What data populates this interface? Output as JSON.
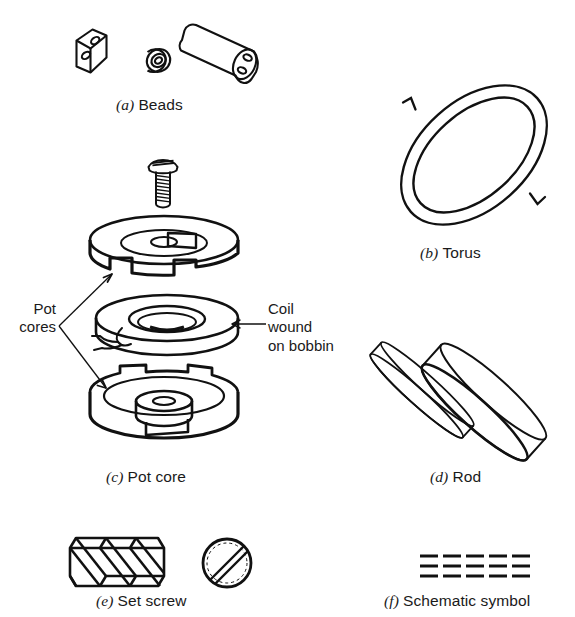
{
  "figure": {
    "background_color": "#ffffff",
    "line_color": "#111111"
  },
  "panels": [
    {
      "id": "a",
      "tag": "(a)",
      "label": "Beads",
      "parts": [
        "two-hole oblong bead",
        "small single-hole bead",
        "two-hole cylindrical bead"
      ]
    },
    {
      "id": "b",
      "tag": "(b)",
      "label": "Torus",
      "parts": [
        "toroidal ring with winding direction arrow"
      ]
    },
    {
      "id": "c",
      "tag": "(c)",
      "label": "Pot core",
      "parts": [
        "slotted pan-head screw",
        "upper pot core half",
        "coil wound on bobbin",
        "lower pot core half"
      ]
    },
    {
      "id": "d",
      "tag": "(d)",
      "label": "Rod",
      "parts": [
        "thin ferrite rod",
        "thick ferrite rod"
      ]
    },
    {
      "id": "e",
      "tag": "(e)",
      "label": "Set screw",
      "parts": [
        "threaded screw side view",
        "slotted screw end view"
      ]
    },
    {
      "id": "f",
      "tag": "(f)",
      "label": "Schematic symbol",
      "parts": [
        "three rows of five dashes"
      ]
    }
  ],
  "annotations": {
    "pot_cores": "Pot\ncores",
    "coil": "Coil\nwound\non bobbin"
  },
  "schematic": {
    "rows": 3,
    "dashes_per_row": 5
  }
}
